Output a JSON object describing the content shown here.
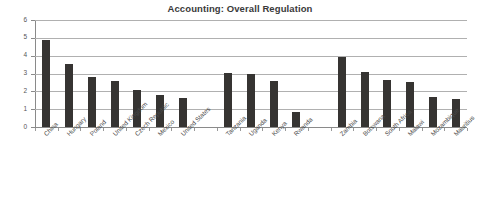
{
  "chart_data": {
    "type": "bar",
    "title": "Accounting: Overall Regulation",
    "xlabel": "",
    "ylabel": "",
    "ylim": [
      0,
      6
    ],
    "ytick_labels": [
      "0",
      "1",
      "2",
      "3",
      "4",
      "5",
      "6"
    ],
    "yticks": [
      0,
      1,
      2,
      3,
      4,
      5,
      6
    ],
    "grid": true,
    "legend": false,
    "bar_color": "#363432",
    "categories": [
      "China",
      "Hungary",
      "Poland",
      "United Kingdom",
      "Czech Republic",
      "Mexico",
      "United States",
      "Tanzania",
      "Uganda",
      "Kenya",
      "Rwanda",
      "Zambia",
      "Botswana",
      "South Africa",
      "Malawi",
      "Mozambique",
      "Mauritius"
    ],
    "values": [
      4.9,
      3.55,
      2.8,
      2.6,
      2.1,
      1.8,
      1.65,
      3.05,
      2.95,
      2.6,
      0.85,
      3.9,
      3.1,
      2.65,
      2.5,
      1.7,
      1.58
    ],
    "groups": [
      {
        "name": "group-1",
        "categories": [
          "China",
          "Hungary",
          "Poland",
          "United Kingdom",
          "Czech Republic",
          "Mexico",
          "United States"
        ]
      },
      {
        "name": "group-2",
        "categories": [
          "Tanzania",
          "Uganda",
          "Kenya",
          "Rwanda"
        ]
      },
      {
        "name": "group-3",
        "categories": [
          "Zambia",
          "Botswana",
          "South Africa",
          "Malawi",
          "Mozambique",
          "Mauritius"
        ]
      }
    ]
  }
}
